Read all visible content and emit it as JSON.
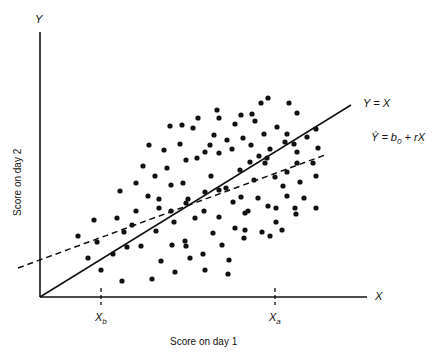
{
  "chart_data": {
    "type": "scatter",
    "title": "",
    "xlabel": "Score on day 1",
    "ylabel": "Score on day 2",
    "x_axis_symbol": "X",
    "y_axis_symbol": "Y",
    "x_ticks": [
      {
        "label": "X_b",
        "main": "X",
        "sub": "b",
        "px": 101
      },
      {
        "label": "X_a",
        "main": "X",
        "sub": "a",
        "px": 275
      }
    ],
    "lines": [
      {
        "name": "identity",
        "label": "Y = X",
        "style": "solid",
        "from": [
          40,
          297
        ],
        "to": [
          351,
          105
        ]
      },
      {
        "name": "regression",
        "label": "Ŷ = b0 + rX",
        "label_main": "Ŷ = b",
        "label_sub": "0",
        "label_tail": " + rX",
        "style": "dashed",
        "from": [
          18,
          268
        ],
        "to": [
          325,
          155
        ]
      }
    ],
    "points_px": [
      [
        78,
        236
      ],
      [
        97,
        242
      ],
      [
        113,
        254
      ],
      [
        88,
        258
      ],
      [
        101,
        270
      ],
      [
        124,
        232
      ],
      [
        127,
        247
      ],
      [
        141,
        246
      ],
      [
        94,
        220
      ],
      [
        117,
        218
      ],
      [
        122,
        281
      ],
      [
        152,
        279
      ],
      [
        175,
        272
      ],
      [
        136,
        211
      ],
      [
        159,
        199
      ],
      [
        156,
        231
      ],
      [
        161,
        261
      ],
      [
        172,
        245
      ],
      [
        132,
        225
      ],
      [
        174,
        222
      ],
      [
        185,
        241
      ],
      [
        190,
        258
      ],
      [
        203,
        254
      ],
      [
        213,
        233
      ],
      [
        222,
        245
      ],
      [
        228,
        274
      ],
      [
        235,
        228
      ],
      [
        120,
        191
      ],
      [
        136,
        183
      ],
      [
        148,
        196
      ],
      [
        159,
        208
      ],
      [
        171,
        211
      ],
      [
        186,
        203
      ],
      [
        195,
        218
      ],
      [
        204,
        211
      ],
      [
        219,
        217
      ],
      [
        233,
        202
      ],
      [
        248,
        211
      ],
      [
        245,
        230
      ],
      [
        262,
        232
      ],
      [
        276,
        222
      ],
      [
        143,
        166
      ],
      [
        155,
        176
      ],
      [
        167,
        168
      ],
      [
        171,
        185
      ],
      [
        183,
        183
      ],
      [
        188,
        199
      ],
      [
        205,
        192
      ],
      [
        211,
        176
      ],
      [
        219,
        190
      ],
      [
        226,
        188
      ],
      [
        241,
        197
      ],
      [
        245,
        213
      ],
      [
        258,
        198
      ],
      [
        268,
        206
      ],
      [
        276,
        208
      ],
      [
        149,
        145
      ],
      [
        164,
        150
      ],
      [
        180,
        144
      ],
      [
        186,
        160
      ],
      [
        197,
        158
      ],
      [
        205,
        152
      ],
      [
        214,
        135
      ],
      [
        219,
        153
      ],
      [
        227,
        140
      ],
      [
        243,
        138
      ],
      [
        251,
        145
      ],
      [
        259,
        156
      ],
      [
        270,
        149
      ],
      [
        285,
        142
      ],
      [
        297,
        152
      ],
      [
        182,
        125
      ],
      [
        198,
        118
      ],
      [
        219,
        118
      ],
      [
        235,
        124
      ],
      [
        255,
        121
      ],
      [
        264,
        134
      ],
      [
        277,
        127
      ],
      [
        287,
        134
      ],
      [
        294,
        144
      ],
      [
        297,
        163
      ],
      [
        313,
        163
      ],
      [
        170,
        126
      ],
      [
        193,
        128
      ],
      [
        210,
        145
      ],
      [
        232,
        149
      ],
      [
        240,
        170
      ],
      [
        250,
        162
      ],
      [
        254,
        180
      ],
      [
        265,
        163
      ],
      [
        275,
        177
      ],
      [
        283,
        186
      ],
      [
        287,
        196
      ],
      [
        300,
        182
      ],
      [
        304,
        198
      ],
      [
        316,
        176
      ],
      [
        316,
        208
      ],
      [
        295,
        208
      ],
      [
        282,
        230
      ],
      [
        296,
        214
      ],
      [
        270,
        236
      ],
      [
        244,
        238
      ],
      [
        229,
        260
      ],
      [
        205,
        270
      ],
      [
        186,
        246
      ],
      [
        217,
        110
      ],
      [
        241,
        115
      ],
      [
        261,
        103
      ],
      [
        289,
        103
      ],
      [
        297,
        113
      ],
      [
        268,
        98
      ],
      [
        252,
        114
      ],
      [
        267,
        158
      ],
      [
        287,
        172
      ],
      [
        307,
        137
      ],
      [
        316,
        129
      ],
      [
        318,
        148
      ]
    ],
    "xlim_px": [
      40,
      367
    ],
    "ylim_px": [
      297,
      32
    ],
    "grid": false,
    "legend": "inline line labels"
  }
}
